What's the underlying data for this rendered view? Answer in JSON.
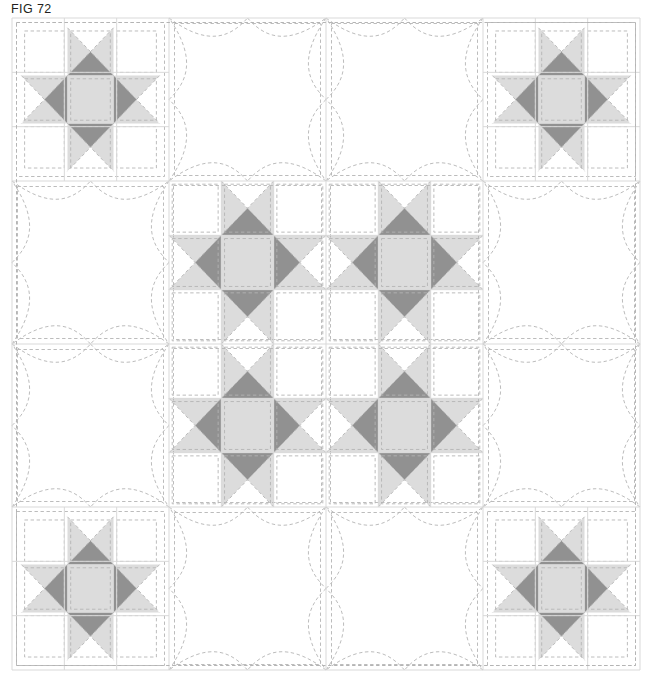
{
  "figure": {
    "label": "FIG 72",
    "caption": "FIG 72"
  },
  "colors": {
    "background": "#ffffff",
    "patch_white": "#ffffff",
    "patch_light_gray": "#dcdcdc",
    "patch_mid_gray": "#d2d2d2",
    "patch_dark_gray": "#919191",
    "stitch_dash": "#b4b4b4",
    "seam_line": "#d9d9d9",
    "label_text": "#231f20"
  },
  "quilt": {
    "title": "Quilt layout diagram",
    "grid_columns": 4,
    "grid_rows": 4,
    "origin_x": 12,
    "origin_y": 18,
    "block_width": 157,
    "block_height": 163,
    "block_types": [
      [
        "star",
        "plain",
        "plain",
        "star"
      ],
      [
        "plain",
        "star",
        "star",
        "plain"
      ],
      [
        "plain",
        "star",
        "star",
        "plain"
      ],
      [
        "star",
        "plain",
        "plain",
        "star"
      ]
    ],
    "star_block": {
      "name": "Ohio Star / Variable Star block",
      "subgrid": 3,
      "corner_patch": "white square",
      "edge_patch": "hourglass quarter-square triangles",
      "center_patch": "light gray square",
      "point_color": "#dcdcdc",
      "inner_color": "#919191",
      "center_color": "#dcdcdc"
    },
    "plain_block": {
      "name": "Plain block with curved quilting motif",
      "motif": "concave four-point star formed by arcs",
      "stitch_style": "dashed"
    },
    "center_medallion": {
      "description": "Four star blocks in the centre scaled up to interlock, forming a large medallion",
      "rows": 2,
      "columns": 2
    }
  }
}
